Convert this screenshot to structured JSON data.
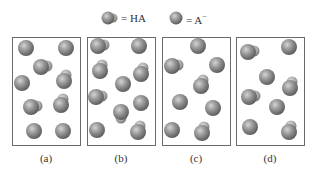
{
  "legend": {
    "ha_label": "= HA",
    "a_label": "= A",
    "a_superscript": "−"
  },
  "colors": {
    "sphere_base": "#8c8c8c",
    "sphere_highlight": "#d0d0d0",
    "sphere_shadow": "#5e5e5e",
    "box_border": "#6a6a6a"
  },
  "panels": [
    {
      "label": "(a)",
      "box": {
        "x": 12,
        "y": 37,
        "w": 68,
        "h": 108
      },
      "molecules": [
        {
          "type": "A-",
          "x": 26,
          "y": 48
        },
        {
          "type": "A-",
          "x": 66,
          "y": 48
        },
        {
          "type": "HA",
          "x": 41,
          "y": 67,
          "dir": 1
        },
        {
          "type": "A-",
          "x": 22,
          "y": 83
        },
        {
          "type": "HA",
          "x": 64,
          "y": 81,
          "dir": -1
        },
        {
          "type": "HA",
          "x": 31,
          "y": 107,
          "dir": 1
        },
        {
          "type": "HA",
          "x": 61,
          "y": 105,
          "dir": -1
        },
        {
          "type": "A-",
          "x": 34,
          "y": 131
        },
        {
          "type": "A-",
          "x": 63,
          "y": 131
        }
      ]
    },
    {
      "label": "(b)",
      "box": {
        "x": 87,
        "y": 37,
        "w": 68,
        "h": 108
      },
      "molecules": [
        {
          "type": "HA",
          "x": 98,
          "y": 46,
          "dir": 1
        },
        {
          "type": "A-",
          "x": 139,
          "y": 46
        },
        {
          "type": "HA",
          "x": 100,
          "y": 71,
          "dir": -1
        },
        {
          "type": "HA",
          "x": 141,
          "y": 74,
          "dir": -1
        },
        {
          "type": "A-",
          "x": 123,
          "y": 84
        },
        {
          "type": "HA",
          "x": 96,
          "y": 97,
          "dir": 1
        },
        {
          "type": "A-",
          "x": 141,
          "y": 103
        },
        {
          "type": "HA",
          "x": 121,
          "y": 112,
          "dir": 2
        },
        {
          "type": "A-",
          "x": 97,
          "y": 130
        },
        {
          "type": "HA",
          "x": 138,
          "y": 132,
          "dir": -1
        }
      ]
    },
    {
      "label": "(c)",
      "box": {
        "x": 162,
        "y": 37,
        "w": 68,
        "h": 108
      },
      "molecules": [
        {
          "type": "A-",
          "x": 198,
          "y": 46
        },
        {
          "type": "HA",
          "x": 172,
          "y": 66,
          "dir": 1
        },
        {
          "type": "A-",
          "x": 217,
          "y": 65
        },
        {
          "type": "HA",
          "x": 201,
          "y": 86,
          "dir": -1
        },
        {
          "type": "A-",
          "x": 180,
          "y": 102
        },
        {
          "type": "A-",
          "x": 213,
          "y": 108
        },
        {
          "type": "A-",
          "x": 172,
          "y": 130
        },
        {
          "type": "HA",
          "x": 202,
          "y": 133,
          "dir": -1
        }
      ]
    },
    {
      "label": "(d)",
      "box": {
        "x": 236,
        "y": 37,
        "w": 68,
        "h": 108
      },
      "molecules": [
        {
          "type": "HA",
          "x": 248,
          "y": 52,
          "dir": 1
        },
        {
          "type": "A-",
          "x": 289,
          "y": 47
        },
        {
          "type": "A-",
          "x": 267,
          "y": 77
        },
        {
          "type": "HA",
          "x": 290,
          "y": 88,
          "dir": -1
        },
        {
          "type": "HA",
          "x": 249,
          "y": 97,
          "dir": 1
        },
        {
          "type": "A-",
          "x": 277,
          "y": 107
        },
        {
          "type": "A-",
          "x": 250,
          "y": 127
        },
        {
          "type": "HA",
          "x": 289,
          "y": 132,
          "dir": -1
        }
      ]
    }
  ]
}
